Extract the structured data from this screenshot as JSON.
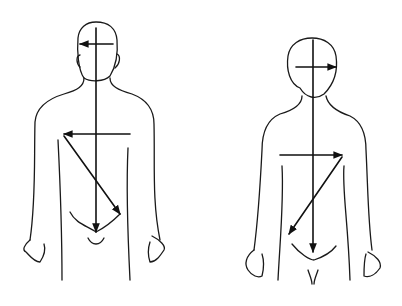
{
  "diagram": {
    "type": "body-outline-line-drawing",
    "figures": [
      {
        "name": "left-figure",
        "arrows": [
          "vertical-midline-arrow-down",
          "head-horizontal-arrow-left",
          "chest-horizontal-arrow-left",
          "diagonal-arrow-down-right"
        ]
      },
      {
        "name": "right-figure",
        "arrows": [
          "vertical-midline-arrow-down",
          "head-horizontal-arrow-right",
          "chest-horizontal-arrow-right",
          "diagonal-arrow-down-left"
        ]
      }
    ],
    "colors": {
      "stroke": "#1a1a1a",
      "background": "#ffffff"
    }
  }
}
